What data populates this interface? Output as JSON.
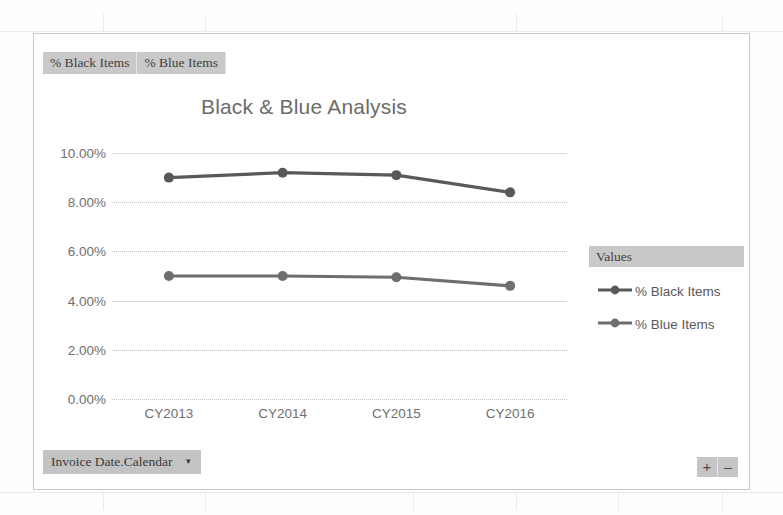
{
  "chart_frame": {
    "legend_field_buttons": [
      {
        "label": "% Black Items"
      },
      {
        "label": "% Blue Items"
      }
    ],
    "axis_field_button": {
      "label": "Invoice Date.Calendar",
      "caret": "▾"
    },
    "legend_panel": {
      "header": "Values",
      "items": [
        {
          "label": "% Black Items",
          "color": "#595959"
        },
        {
          "label": "% Blue Items",
          "color": "#6e6e6e"
        }
      ]
    },
    "zoom_buttons": [
      {
        "label": "+",
        "name": "zoom-in"
      },
      {
        "label": "–",
        "name": "zoom-out"
      }
    ]
  },
  "chart_data": {
    "type": "line",
    "title": "Black & Blue Analysis",
    "xlabel": "",
    "ylabel": "",
    "categories": [
      "CY2013",
      "CY2014",
      "CY2015",
      "CY2016"
    ],
    "series": [
      {
        "name": "% Black Items",
        "color": "#595959",
        "values": [
          9.0,
          9.2,
          9.1,
          8.4
        ]
      },
      {
        "name": "% Blue Items",
        "color": "#6e6e6e",
        "values": [
          5.0,
          5.0,
          4.95,
          4.6
        ]
      }
    ],
    "ylim": [
      0,
      10
    ],
    "ytick_labels": [
      "10.00%",
      "8.00%",
      "6.00%",
      "4.00%",
      "2.00%",
      "0.00%"
    ],
    "ytick_values": [
      10,
      8,
      6,
      4,
      2,
      0
    ],
    "grid": true,
    "legend_position": "right"
  }
}
